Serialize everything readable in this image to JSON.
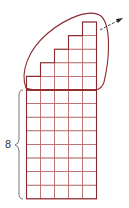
{
  "diagram": {
    "brace_label": "8",
    "grid": {
      "columns": 5,
      "rows": 8
    },
    "staircase_heights": [
      1,
      2,
      3,
      4,
      5
    ],
    "colors": {
      "grid": "#8b2a2e",
      "grid_light": "#b86a6c",
      "loop": "#8b2a2e",
      "arrow": "#333333",
      "brace": "#555555"
    }
  }
}
